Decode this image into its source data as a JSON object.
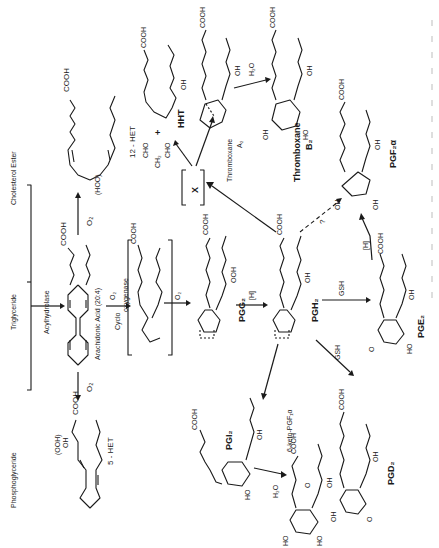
{
  "figure": {
    "orientation": "rotated-90-clockwise",
    "sources": [
      "Phosphoglyceride",
      "Triglyceride",
      "Cholesterol Ester"
    ],
    "enzymes": {
      "acylhydrolase": "Acylhydrolase",
      "cyclooxygenase_a": "Cyclo",
      "cyclooxygenase_b": "oxygenase"
    },
    "reagents": {
      "o2": "O₂",
      "h2o": "H₂O",
      "reduction": "[H]",
      "gsh": "GSH",
      "unknown": "?",
      "intermediate_x": "X",
      "plus": "+"
    },
    "compounds": {
      "arachidonic_acid": "Arachidonic Acid (20:4)",
      "het5": "5 - HET",
      "het12": "12 - HET",
      "hmt": "HHT",
      "mda_a": "CHO",
      "mda_b": "CH₂",
      "mda_c": "CHO",
      "pgg2": "PGG₂",
      "pgh2": "PGH₂",
      "pge2": "PGE₂",
      "pgd2": "PGD₂",
      "pgf2a": "PGF₂α",
      "pgi2": "PGI₂",
      "keto_pgf1a": "6-keto-PGF₁α",
      "txa2_a": "Thromboxane",
      "txa2_b": "A₂",
      "txb2_a": "Thromboxane",
      "txb2_b": "B₂"
    },
    "groups": {
      "cooh": "COOH",
      "oh": "OH",
      "ho": "HO",
      "ooh": "OOH",
      "ooh_paren": "(OOH)",
      "hoo_paren": "(HOO)",
      "o": "O"
    }
  }
}
